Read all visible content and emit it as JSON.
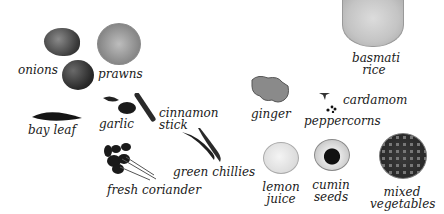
{
  "ingredients": [
    {
      "id": "onions",
      "label": "onions"
    },
    {
      "id": "prawns",
      "label": "prawns"
    },
    {
      "id": "basmati_rice",
      "label_line1": "basmati",
      "label_line2": "rice"
    },
    {
      "id": "bay_leaf",
      "label": "bay leaf"
    },
    {
      "id": "garlic",
      "label": "garlic"
    },
    {
      "id": "cinnamon_stick",
      "label_line1": "cinnamon",
      "label_line2": "stick"
    },
    {
      "id": "ginger",
      "label": "ginger"
    },
    {
      "id": "cardamom",
      "label": "cardamom"
    },
    {
      "id": "peppercorns",
      "label": "peppercorns"
    },
    {
      "id": "green_chillies",
      "label": "green chillies"
    },
    {
      "id": "fresh_coriander",
      "label": "fresh coriander"
    },
    {
      "id": "lemon_juice",
      "label_line1": "lemon",
      "label_line2": "juice"
    },
    {
      "id": "cumin_seeds",
      "label_line1": "cumin",
      "label_line2": "seeds"
    },
    {
      "id": "mixed_vegetables",
      "label_line1": "mixed",
      "label_line2": "vegetables"
    }
  ],
  "colors": {
    "background": "#ffffff",
    "text": "#1a1a1a"
  }
}
